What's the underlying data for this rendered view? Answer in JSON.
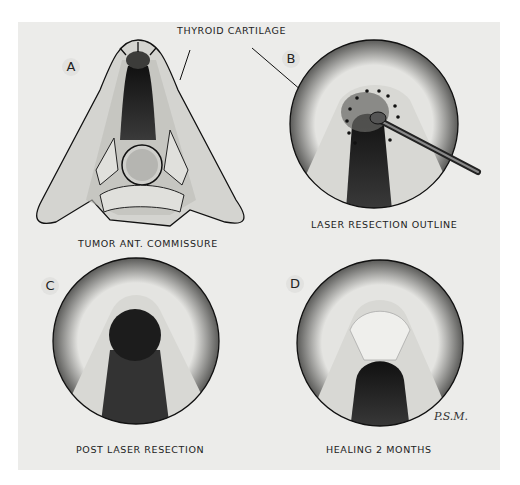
{
  "figure": {
    "title_label": "THYROID CARTILAGE",
    "signature": "P.S.M.",
    "panels": [
      {
        "letter": "A",
        "caption": "TUMOR ANT. COMMISSURE"
      },
      {
        "letter": "B",
        "caption": "LASER RESECTION OUTLINE"
      },
      {
        "letter": "C",
        "caption": "POST LASER RESECTION"
      },
      {
        "letter": "D",
        "caption": "HEALING 2 MONTHS"
      }
    ]
  },
  "colors": {
    "paper": "#ececea",
    "ink": "#222222",
    "cartilage": "#d6d6d3",
    "airway": "#2a2a2a"
  }
}
